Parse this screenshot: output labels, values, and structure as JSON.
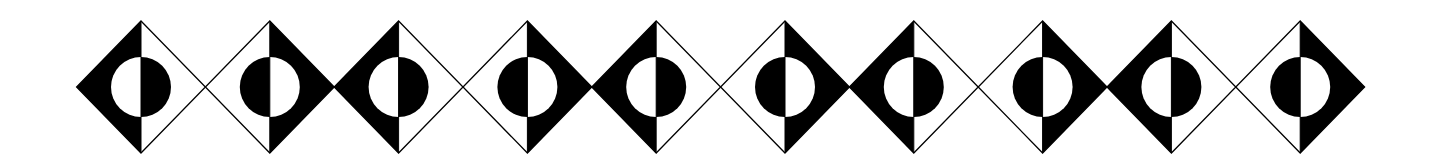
{
  "pattern": {
    "title": "Diamond and half-circle frieze",
    "colors": {
      "background": "#ffffff",
      "ink": "#000000",
      "outline": "#000000"
    },
    "layout": {
      "first_center_x": 141,
      "center_y": 87,
      "pitch": 128.8,
      "half_width": 64.4,
      "half_height": 66,
      "circle_radius": 30,
      "stroke_width": 1.3
    },
    "diamonds": [
      {
        "index": 1,
        "variant": "A",
        "black_half": "left",
        "circle_black_half": "right"
      },
      {
        "index": 2,
        "variant": "B",
        "black_half": "right",
        "circle_black_half": "left"
      },
      {
        "index": 3,
        "variant": "A",
        "black_half": "left",
        "circle_black_half": "right"
      },
      {
        "index": 4,
        "variant": "B",
        "black_half": "right",
        "circle_black_half": "left"
      },
      {
        "index": 5,
        "variant": "A",
        "black_half": "left",
        "circle_black_half": "right"
      },
      {
        "index": 6,
        "variant": "B",
        "black_half": "right",
        "circle_black_half": "left"
      },
      {
        "index": 7,
        "variant": "A",
        "black_half": "left",
        "circle_black_half": "right"
      },
      {
        "index": 8,
        "variant": "B",
        "black_half": "right",
        "circle_black_half": "left"
      },
      {
        "index": 9,
        "variant": "A",
        "black_half": "left",
        "circle_black_half": "right"
      },
      {
        "index": 10,
        "variant": "B",
        "black_half": "right",
        "circle_black_half": "left"
      }
    ]
  }
}
